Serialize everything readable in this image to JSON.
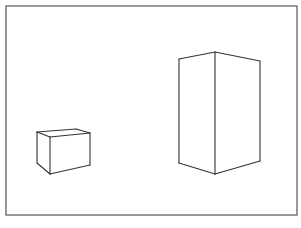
{
  "canvas": {
    "width": 301,
    "height": 228,
    "background": "#ffffff"
  },
  "stroke": {
    "color": "#333333",
    "frame_color": "#555555"
  },
  "frame": {
    "x": 6,
    "y": 6,
    "width": 291,
    "height": 209
  },
  "shapes": [
    {
      "name": "small-box",
      "edges": [
        [
          37,
          132,
          76,
          129
        ],
        [
          76,
          129,
          90,
          133
        ],
        [
          37,
          132,
          50,
          137
        ],
        [
          50,
          137,
          90,
          133
        ],
        [
          37,
          132,
          37,
          163
        ],
        [
          50,
          137,
          50,
          174
        ],
        [
          90,
          133,
          90,
          165
        ],
        [
          37,
          163,
          50,
          174
        ],
        [
          50,
          174,
          90,
          165
        ]
      ]
    },
    {
      "name": "tall-box",
      "edges": [
        [
          179,
          59,
          215,
          52
        ],
        [
          215,
          52,
          260,
          61
        ],
        [
          179,
          59,
          179,
          163
        ],
        [
          215,
          52,
          215,
          174
        ],
        [
          260,
          61,
          260,
          161
        ],
        [
          179,
          163,
          215,
          174
        ],
        [
          215,
          174,
          260,
          161
        ]
      ]
    }
  ]
}
